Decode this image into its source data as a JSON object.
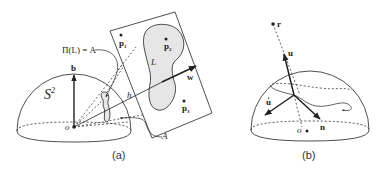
{
  "panel_a": {
    "caption": "(a)",
    "sphere_label": "S",
    "sphere_sup": "2",
    "origin_label": "o",
    "b_label": "b",
    "pi_label": "Π(L) = A",
    "L_label": "L",
    "h_label": "h",
    "w_label": "w",
    "A_label": "A",
    "points": [
      {
        "label": "p",
        "sub": "1"
      },
      {
        "label": "p",
        "sub": "2"
      },
      {
        "label": "p",
        "sub": "3"
      }
    ]
  },
  "panel_b": {
    "caption": "(b)",
    "r_label": "r",
    "u_label": "u",
    "udot_label": "u",
    "n_label": "n",
    "origin_label": "o"
  },
  "colors": {
    "stroke": "#222222",
    "region_fill": "#e6e6e6",
    "background": "#ffffff"
  }
}
